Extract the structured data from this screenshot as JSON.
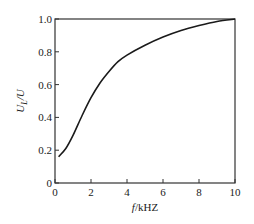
{
  "chart_data": {
    "type": "line",
    "title": "",
    "xlabel": "f/kHZ",
    "ylabel": "U_L/U",
    "xlim": [
      0,
      10
    ],
    "ylim": [
      0,
      1.0
    ],
    "xticks": [
      0,
      2,
      4,
      6,
      8,
      10
    ],
    "yticks": [
      0,
      0.2,
      0.4,
      0.6,
      0.8,
      1.0
    ],
    "xtick_labels": [
      "0",
      "2",
      "4",
      "6",
      "8",
      "10"
    ],
    "ytick_labels": [
      "0",
      "0.2",
      "0.4",
      "0.6",
      "0.8",
      "1.0"
    ],
    "grid": false,
    "series": [
      {
        "name": "U_L/U",
        "x": [
          0.2,
          0.6,
          1.0,
          1.5,
          2.0,
          2.5,
          3.0,
          3.5,
          4.0,
          5.0,
          6.0,
          7.0,
          8.0,
          9.0,
          10.0
        ],
        "values": [
          0.16,
          0.21,
          0.29,
          0.41,
          0.52,
          0.61,
          0.68,
          0.74,
          0.78,
          0.84,
          0.89,
          0.93,
          0.96,
          0.985,
          1.0
        ]
      }
    ]
  },
  "axis": {
    "x_label_f": "f",
    "x_label_unit": "/kHZ",
    "y_label_main": "U",
    "y_label_sub": "L",
    "y_label_den": "/U"
  }
}
